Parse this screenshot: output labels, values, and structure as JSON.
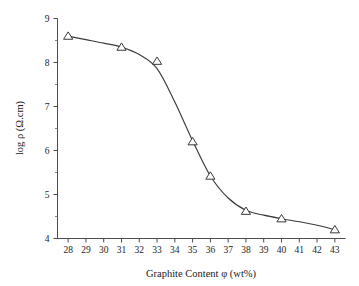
{
  "chart_data": {
    "type": "line",
    "title": "",
    "subtitle": "",
    "xlabel": "Graphite Content φ (wt%)",
    "ylabel": "log ρ (Ω.cm)",
    "xlim": [
      27.4,
      43.6
    ],
    "ylim": [
      4,
      9
    ],
    "xticks": [
      28,
      29,
      30,
      31,
      32,
      33,
      34,
      35,
      36,
      37,
      38,
      39,
      40,
      41,
      42,
      43
    ],
    "xtick_labels": [
      "28",
      "29",
      "30",
      "31",
      "32",
      "33",
      "34",
      "35",
      "36",
      "37",
      "38",
      "39",
      "40",
      "41",
      "42",
      "43"
    ],
    "yticks": [
      4,
      5,
      6,
      7,
      8,
      9
    ],
    "ytick_labels": [
      "4",
      "5",
      "6",
      "7",
      "8",
      "9"
    ],
    "y_minor_ticks": [
      4.5,
      5.5,
      6.5,
      7.5,
      8.5
    ],
    "grid": false,
    "legend": null,
    "legend_position": "none",
    "marker": "open-triangle-up",
    "line_color": "#3b3b3b",
    "marker_edge_color": "#2e2e2e",
    "marker_face_color": "#ffffff",
    "background_color": "#ffffff",
    "axis_color": "#4d4d4d",
    "series": [
      {
        "name": "log ρ vs graphite content",
        "x": [
          28,
          31,
          33,
          35,
          36,
          38,
          40,
          43
        ],
        "values": [
          8.6,
          8.35,
          8.03,
          6.2,
          5.42,
          4.62,
          4.45,
          4.2
        ]
      }
    ],
    "fit_curve": {
      "description": "smooth sigmoidal fit through the data points",
      "x": [
        28,
        29,
        30,
        31,
        32,
        33,
        34,
        35,
        36,
        37,
        38,
        39,
        40,
        41,
        42,
        43
      ],
      "values": [
        8.6,
        8.52,
        8.44,
        8.35,
        8.18,
        7.86,
        7.1,
        6.22,
        5.42,
        4.92,
        4.64,
        4.53,
        4.45,
        4.38,
        4.3,
        4.2
      ]
    },
    "annotations": []
  }
}
